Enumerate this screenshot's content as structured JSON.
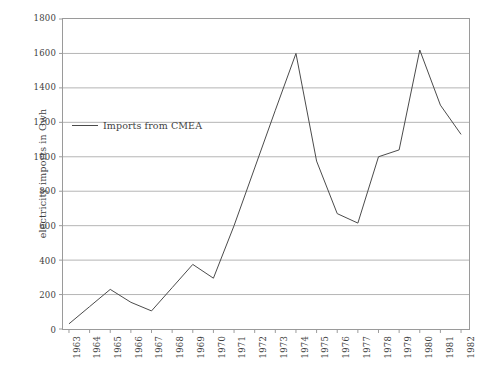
{
  "chart_data": {
    "type": "line",
    "title": "",
    "xlabel": "",
    "ylabel": "electricity imports in Gwh",
    "categories": [
      "1963",
      "1964",
      "1965",
      "1966",
      "1967",
      "1968",
      "1969",
      "1970",
      "1971",
      "1972",
      "1973",
      "1974",
      "1975",
      "1976",
      "1977",
      "1978",
      "1979",
      "1980",
      "1981",
      "1982"
    ],
    "series": [
      {
        "name": "Imports from CMEA",
        "values": [
          30,
          130,
          230,
          155,
          105,
          240,
          375,
          295,
          600,
          935,
          1270,
          1600,
          975,
          670,
          615,
          1000,
          1040,
          1620,
          1300,
          1130
        ]
      }
    ],
    "ylim": [
      0,
      1800
    ],
    "y_ticks": [
      "0",
      "200",
      "400",
      "600",
      "800",
      "1000",
      "1200",
      "1400",
      "1600",
      "1800"
    ],
    "grid": true,
    "legend_position": "inside-upper-left",
    "line_color": "#4a4a4a",
    "grid_color": "#b4b4b4",
    "frame_color": "#9a9a9a"
  },
  "legend": {
    "entries": [
      {
        "label": "Imports from CMEA"
      }
    ]
  }
}
